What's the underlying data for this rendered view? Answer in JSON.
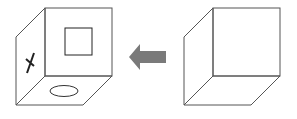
{
  "diagram": {
    "colors": {
      "background": "#ffffff",
      "line": "#555555",
      "symbol": "#222222",
      "arrow": "#7a7a7a"
    },
    "left_cube": {
      "front_face_symbol": "square",
      "left_face_symbol": "X",
      "bottom_face_symbol": "ellipse"
    },
    "arrow": {
      "direction": "left"
    },
    "right_cube": {
      "faces": "blank"
    }
  }
}
